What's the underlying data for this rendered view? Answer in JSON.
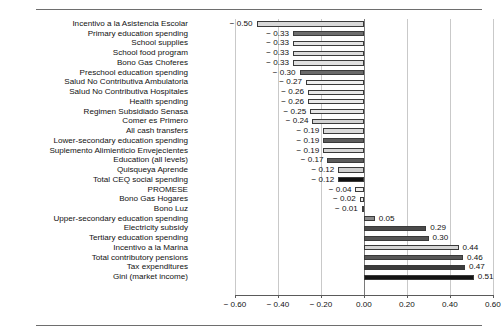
{
  "chart_data": {
    "type": "bar",
    "orientation": "horizontal",
    "title": "",
    "subtitle": "",
    "xlabel": "",
    "ylabel": "",
    "xlim": [
      -0.6,
      0.6
    ],
    "xticks": [
      -0.6,
      -0.4,
      -0.2,
      0.0,
      0.2,
      0.4,
      0.6
    ],
    "xtick_labels": [
      "− 0.60",
      "− 0.40",
      "− 0.20",
      "0.00",
      "0.20",
      "0.40",
      "0.60"
    ],
    "grid": true,
    "legend": null,
    "categories": [
      "Incentivo a la Asistencia Escolar",
      "Primary education spending",
      "School supplies",
      "School food program",
      "Bono Gas Choferes",
      "Preschool education spending",
      "Salud No Contributiva Ambulatoria",
      "Salud No Contributiva Hospitales",
      "Health spending",
      "Regimen Subsidiado Senasa",
      "Comer es Primero",
      "All cash transfers",
      "Lower-secondary education spending",
      "Suplemento Alimienticio Envejecientes",
      "Education (all levels)",
      "Quisqueya Aprende",
      "Total CEQ social spending",
      "PROMESE",
      "Bono Gas Hogares",
      "Bono Luz",
      "Upper-secondary education spending",
      "Electricity subsidy",
      "Tertiary education spending",
      "Incentivo a la Marina",
      "Total contributory pensions",
      "Tax expenditures",
      "Gini (market income)"
    ],
    "values": [
      -0.5,
      -0.33,
      -0.33,
      -0.33,
      -0.33,
      -0.3,
      -0.27,
      -0.26,
      -0.26,
      -0.25,
      -0.24,
      -0.19,
      -0.19,
      -0.19,
      -0.17,
      -0.12,
      -0.12,
      -0.04,
      -0.02,
      -0.01,
      0.05,
      0.29,
      0.3,
      0.44,
      0.46,
      0.47,
      0.51
    ],
    "value_labels": [
      "− 0.50",
      "− 0.33",
      "− 0.33",
      "− 0.33",
      "− 0.33",
      "− 0.30",
      "− 0.27",
      "− 0.26",
      "− 0.26",
      "− 0.25",
      "− 0.24",
      "− 0.19",
      "− 0.19",
      "− 0.19",
      "− 0.17",
      "− 0.12",
      "− 0.12",
      "− 0.04",
      "− 0.02",
      "− 0.01",
      "0.05",
      "0.29",
      "0.30",
      "0.44",
      "0.46",
      "0.47",
      "0.51"
    ],
    "bar_colors": [
      "#d8d8d8",
      "#6e6e6e",
      "#e4e4e4",
      "#dcdcdc",
      "#e0e0e0",
      "#6a6a6a",
      "#efefef",
      "#e8e8e8",
      "#eaeaea",
      "#e6e6e6",
      "#d2d2d2",
      "#dadada",
      "#5e5e5e",
      "#d6d6d6",
      "#5a5a5a",
      "#cfcfcf",
      "#111111",
      "#f0f0f0",
      "#ededed",
      "#ebebeb",
      "#8a8a8a",
      "#4a4a4a",
      "#555555",
      "#d5d5d5",
      "#575757",
      "#3c3c3c",
      "#141414"
    ],
    "bar_edge_color": "#3a3a3a"
  },
  "frame": {
    "top_rule": true,
    "bottom_rule": true,
    "rule_color": "#6e6e6e"
  }
}
